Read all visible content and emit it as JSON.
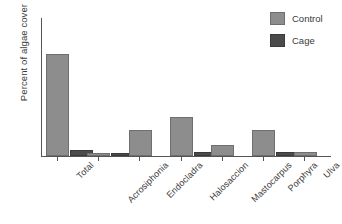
{
  "chart_data": {
    "type": "bar",
    "title": "",
    "xlabel": "",
    "ylabel": "Percent of algae cover",
    "categories": [
      "Total",
      "Acrosiphonia",
      "Endocladra",
      "Halosaccion",
      "Mastocarpus",
      "Porphyra",
      "Ulva"
    ],
    "series": [
      {
        "name": "Control",
        "color": "#8d8d8d",
        "values": [
          74,
          2,
          19,
          28,
          8,
          19,
          3
        ]
      },
      {
        "name": "Cage",
        "color": "#4b4b4b",
        "values": [
          4,
          1,
          0,
          3,
          0,
          3,
          0
        ]
      }
    ],
    "ylim": [
      0,
      100
    ],
    "y_ticks": [],
    "grid": false,
    "legend_position": "top-right",
    "x_tick_label_rotation": 45,
    "axis_color": "#555555"
  },
  "legend": {
    "entries": [
      {
        "label": "Control",
        "swatch": "control-swatch"
      },
      {
        "label": "Cage",
        "swatch": "cage-swatch"
      }
    ]
  },
  "axes": {
    "y_title": "Percent of algae cover"
  }
}
